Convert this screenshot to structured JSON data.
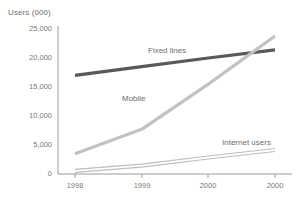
{
  "chart_data": {
    "type": "line",
    "title": "",
    "subtitle": "",
    "xlabel": "",
    "ylabel": "Users (000)",
    "categories": [
      "1998",
      "1999",
      "2000",
      "2000"
    ],
    "x": [
      1998,
      1999,
      2000,
      2001
    ],
    "ylim": [
      0,
      25000
    ],
    "xlim": [
      0,
      3
    ],
    "grid": false,
    "legend_position": "inline-annotations",
    "yticks": [
      0,
      5000,
      10000,
      15000,
      20000,
      25000
    ],
    "ytick_labels": [
      "0",
      "5,000",
      "10,000",
      "15,000",
      "20,000",
      "25,000"
    ],
    "xtick_labels": [
      "1998",
      "1999",
      "2000",
      "2000"
    ],
    "series": [
      {
        "name": "Fixed lines",
        "values": [
          17000,
          18500,
          20000,
          21400
        ],
        "color": "#595959",
        "width": 3.2,
        "label_x": 148,
        "label_y": 52
      },
      {
        "name": "Mobile",
        "values": [
          3500,
          7700,
          15500,
          23800
        ],
        "color": "#c2c2c2",
        "width": 3.2,
        "label_x": 163,
        "label_y": 100
      },
      {
        "name": "Internet users",
        "values": [
          800,
          1700,
          3100,
          4400
        ],
        "color": "#bdbdbd",
        "width": 1.1,
        "label_x": 228,
        "label_y": 143
      }
    ],
    "axis_color": "#9a9a9a",
    "text_color": "#6e6e6e"
  },
  "axis": {
    "y_title": "Users (000)"
  }
}
